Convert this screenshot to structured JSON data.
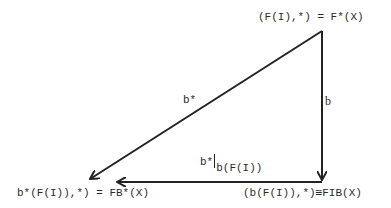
{
  "nodes": {
    "top_right": "(F(I),*) = F*(X)",
    "bottom_left": "b*(F(I)),*)  = FB*(X)",
    "bottom_right": "(b(F(I)),*)≅FIB(X)"
  },
  "arrows": {
    "diagonal": {
      "label": "b*",
      "from": "top_right",
      "to": "bottom_left"
    },
    "vertical": {
      "label": "b",
      "from": "top_right",
      "to": "bottom_right"
    },
    "horizontal": {
      "label_main": "b*",
      "label_sub": "b(F(I))",
      "from": "bottom_right",
      "to": "bottom_left"
    }
  },
  "colors": {
    "ink": "#222222",
    "background": "#ffffff"
  }
}
